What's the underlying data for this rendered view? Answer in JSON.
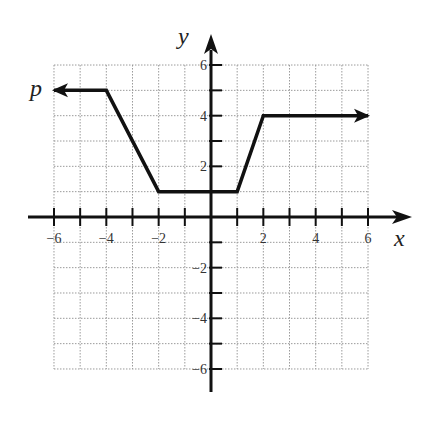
{
  "chart_data": {
    "type": "line",
    "title": "",
    "xlabel": "x",
    "ylabel": "y",
    "series": [
      {
        "name": "p",
        "points": [
          [
            -6,
            5
          ],
          [
            -4,
            5
          ],
          [
            -2,
            1
          ],
          [
            1,
            1
          ],
          [
            2,
            4
          ],
          [
            6,
            4
          ]
        ],
        "left_arrow": true,
        "right_arrow": true
      }
    ],
    "xlim": [
      -6,
      6
    ],
    "ylim": [
      -6,
      6
    ],
    "x_ticks": [
      -6,
      -5,
      -4,
      -3,
      -2,
      -1,
      0,
      1,
      2,
      3,
      4,
      5,
      6
    ],
    "y_ticks": [
      -6,
      -5,
      -4,
      -3,
      -2,
      -1,
      0,
      1,
      2,
      3,
      4,
      5,
      6
    ],
    "x_tick_labels": [
      {
        "value": -6,
        "label": "−6"
      },
      {
        "value": -4,
        "label": "−4"
      },
      {
        "value": -2,
        "label": "−2"
      },
      {
        "value": 2,
        "label": "2"
      },
      {
        "value": 4,
        "label": "4"
      },
      {
        "value": 6,
        "label": "6"
      }
    ],
    "y_tick_labels": [
      {
        "value": 6,
        "label": "6"
      },
      {
        "value": 4,
        "label": "4"
      },
      {
        "value": 2,
        "label": "2"
      },
      {
        "value": -2,
        "label": "−2"
      },
      {
        "value": -4,
        "label": "−4"
      },
      {
        "value": -6,
        "label": "−6"
      }
    ],
    "grid": true,
    "curve_label": "p"
  },
  "layout": {
    "origin_px": [
      211,
      217
    ],
    "unit_x_px": 26.17,
    "unit_y_px": 25.33,
    "colors": {
      "axis": "#111111",
      "curve": "#111111",
      "grid": "#9a9a9a",
      "text": "#333333"
    }
  }
}
